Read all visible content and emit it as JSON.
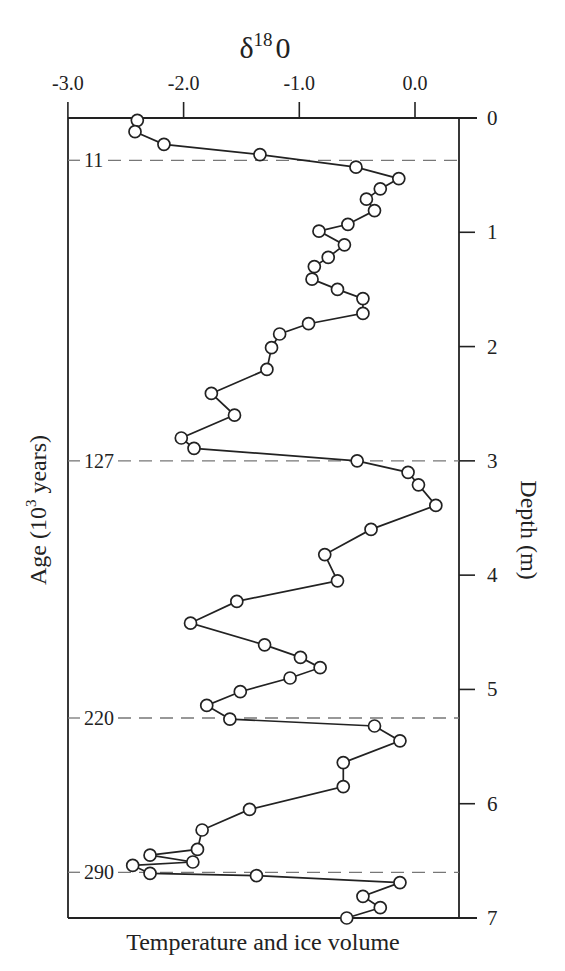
{
  "chart_data": {
    "type": "line",
    "orientation": "vertical-profile",
    "title_parts": {
      "base": "δ",
      "sup": "18",
      "tail": "0"
    },
    "xlabel": "Temperature and ice volume",
    "ylabel_left": "Age (10³ years)",
    "ylabel_left_parts": {
      "pre": "Age (10",
      "sup": "3",
      "post": " years)"
    },
    "ylabel_right": "Depth (m)",
    "x_axis": {
      "position": "top",
      "range": [
        -3.0,
        0.45
      ],
      "ticks": [
        -3.0,
        -2.0,
        -1.0,
        0.0
      ],
      "tick_labels": [
        "-3.0",
        "-2.0",
        "-1.0",
        "0.0"
      ]
    },
    "y_axis": {
      "position": "right",
      "range": [
        0,
        7
      ],
      "inverted": true,
      "ticks": [
        0,
        1,
        2,
        3,
        4,
        5,
        6,
        7
      ],
      "tick_labels": [
        "0",
        "1",
        "2",
        "3",
        "4",
        "5",
        "6",
        "7"
      ]
    },
    "age_markers": [
      {
        "label": "11",
        "depth": 0.37
      },
      {
        "label": "127",
        "depth": 3.0
      },
      {
        "label": "220",
        "depth": 5.25
      },
      {
        "label": "290",
        "depth": 6.6
      }
    ],
    "grid": false,
    "legend": null,
    "marker": "open-circle",
    "series": [
      {
        "name": "δ18O",
        "x": [
          -2.4,
          -2.42,
          -2.17,
          -1.34,
          -0.51,
          -0.14,
          -0.3,
          -0.42,
          -0.35,
          -0.58,
          -0.83,
          -0.61,
          -0.75,
          -0.87,
          -0.89,
          -0.67,
          -0.45,
          -0.45,
          -0.92,
          -1.17,
          -1.24,
          -1.28,
          -1.76,
          -1.56,
          -2.02,
          -1.91,
          -0.5,
          -0.06,
          0.03,
          0.18,
          -0.38,
          -0.78,
          -0.67,
          -1.54,
          -1.94,
          -1.3,
          -0.99,
          -0.82,
          -1.08,
          -1.51,
          -1.8,
          -1.6,
          -0.35,
          -0.13,
          -0.62,
          -0.62,
          -1.43,
          -1.84,
          -1.88,
          -2.29,
          -1.92,
          -2.44,
          -2.29,
          -1.37,
          -0.13,
          -0.45,
          -0.3,
          -0.59
        ],
        "y": [
          0.02,
          0.12,
          0.23,
          0.32,
          0.43,
          0.53,
          0.62,
          0.71,
          0.81,
          0.93,
          0.99,
          1.11,
          1.22,
          1.3,
          1.41,
          1.5,
          1.58,
          1.71,
          1.8,
          1.89,
          2.01,
          2.2,
          2.41,
          2.6,
          2.8,
          2.89,
          3.0,
          3.1,
          3.21,
          3.39,
          3.6,
          3.82,
          4.05,
          4.23,
          4.42,
          4.61,
          4.72,
          4.81,
          4.9,
          5.02,
          5.14,
          5.26,
          5.32,
          5.45,
          5.64,
          5.85,
          6.05,
          6.23,
          6.4,
          6.45,
          6.51,
          6.54,
          6.61,
          6.63,
          6.69,
          6.81,
          6.91,
          7.0
        ]
      }
    ]
  },
  "colors": {
    "ink": "#222222",
    "dash": "#777777",
    "background": "#ffffff"
  }
}
